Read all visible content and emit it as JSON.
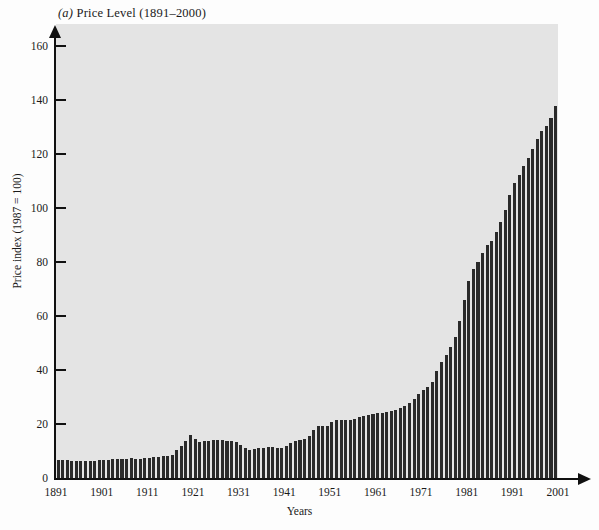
{
  "chart_data": {
    "type": "bar",
    "title": "(a) Price Level (1891–2000)",
    "title_prefix": "(a)",
    "title_rest": " Price Level (1891–2000)",
    "xlabel": "Years",
    "ylabel": "Price index (1987 = 100)",
    "ylim": [
      0,
      168
    ],
    "xlim": [
      1891,
      2001
    ],
    "grid": false,
    "legend": false,
    "y_ticks": [
      0,
      20,
      40,
      60,
      80,
      100,
      120,
      140,
      160
    ],
    "x_ticks": [
      1891,
      1901,
      1911,
      1921,
      1931,
      1941,
      1951,
      1961,
      1971,
      1981,
      1991,
      2001
    ],
    "series_name": "Price index (1987 = 100)",
    "bar_color": "#2a2a2a",
    "plot_background": "#e4e4e4",
    "x": [
      1891,
      1892,
      1893,
      1894,
      1895,
      1896,
      1897,
      1898,
      1899,
      1900,
      1901,
      1902,
      1903,
      1904,
      1905,
      1906,
      1907,
      1908,
      1909,
      1910,
      1911,
      1912,
      1913,
      1914,
      1915,
      1916,
      1917,
      1918,
      1919,
      1920,
      1921,
      1922,
      1923,
      1924,
      1925,
      1926,
      1927,
      1928,
      1929,
      1930,
      1931,
      1932,
      1933,
      1934,
      1935,
      1936,
      1937,
      1938,
      1939,
      1940,
      1941,
      1942,
      1943,
      1944,
      1945,
      1946,
      1947,
      1948,
      1949,
      1950,
      1951,
      1952,
      1953,
      1954,
      1955,
      1956,
      1957,
      1958,
      1959,
      1960,
      1961,
      1962,
      1963,
      1964,
      1965,
      1966,
      1967,
      1968,
      1969,
      1970,
      1971,
      1972,
      1973,
      1974,
      1975,
      1976,
      1977,
      1978,
      1979,
      1980,
      1981,
      1982,
      1983,
      1984,
      1985,
      1986,
      1987,
      1988,
      1989,
      1990,
      1991,
      1992,
      1993,
      1994,
      1995,
      1996,
      1997,
      1998,
      1999,
      2000
    ],
    "values": [
      6.6,
      6.6,
      6.6,
      6.3,
      6.2,
      6.2,
      6.2,
      6.2,
      6.3,
      6.5,
      6.5,
      6.7,
      6.9,
      6.9,
      6.9,
      7.0,
      7.3,
      7.2,
      7.2,
      7.5,
      7.5,
      7.7,
      7.9,
      8.0,
      8.1,
      8.7,
      10.2,
      12.0,
      13.8,
      16.0,
      14.3,
      13.4,
      13.6,
      13.7,
      14.0,
      14.2,
      13.9,
      13.7,
      13.7,
      13.4,
      12.2,
      11.0,
      10.4,
      10.7,
      11.0,
      11.1,
      11.5,
      11.3,
      11.1,
      11.2,
      11.8,
      13.0,
      13.8,
      14.1,
      14.4,
      15.6,
      17.9,
      19.3,
      19.1,
      19.3,
      20.8,
      21.3,
      21.5,
      21.5,
      21.4,
      21.8,
      22.5,
      23.1,
      23.3,
      23.7,
      23.9,
      24.2,
      24.5,
      24.8,
      25.2,
      26.0,
      26.8,
      27.9,
      29.4,
      31.1,
      32.5,
      33.5,
      35.6,
      39.5,
      43.1,
      45.6,
      48.6,
      52.3,
      58.2,
      66.0,
      72.8,
      77.3,
      79.8,
      83.2,
      86.2,
      87.8,
      91.0,
      94.7,
      99.3,
      104.6,
      109.0,
      112.3,
      115.6,
      118.6,
      121.9,
      125.5,
      128.4,
      130.4,
      133.2,
      137.7
    ],
    "peaks_annotated": [
      {
        "year": 1920,
        "value": 16.0
      },
      {
        "year": 1933,
        "value": 10.4
      },
      {
        "year": 2000,
        "value": 150.5
      }
    ]
  }
}
